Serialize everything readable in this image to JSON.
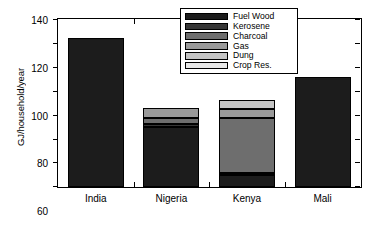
{
  "chart_data": {
    "type": "bar",
    "subtype": "stacked-vertical",
    "title": "",
    "xlabel": "",
    "ylabel": "GJ/household/year",
    "categories": [
      "India",
      "Nigeria",
      "Kenya",
      "Mali"
    ],
    "ylim": [
      0,
      140
    ],
    "yticks": [
      0,
      20,
      40,
      60,
      80,
      100,
      120,
      140
    ],
    "ytick_labels": [
      "0",
      "20",
      "40",
      "60",
      "80",
      "100",
      "120",
      "140"
    ],
    "grid": false,
    "legend_position": "top-right-inside",
    "series": [
      {
        "name": "Fuel Wood",
        "color": "#1c1c1c",
        "values": [
          125,
          50,
          10,
          92
        ]
      },
      {
        "name": "Kerosene",
        "color": "#363636",
        "values": [
          0,
          3,
          2,
          0
        ]
      },
      {
        "name": "Charcoal",
        "color": "#6e6e6e",
        "values": [
          0,
          5,
          46,
          0
        ]
      },
      {
        "name": "Gas",
        "color": "#9a9a9a",
        "values": [
          0,
          8,
          7,
          0
        ]
      },
      {
        "name": "Dung",
        "color": "#c4c4c4",
        "values": [
          0,
          0,
          8,
          0
        ]
      },
      {
        "name": "Crop Res.",
        "color": "#e8e8e8",
        "values": [
          0,
          0,
          0,
          0
        ]
      }
    ],
    "totals": [
      125,
      66,
      73,
      92
    ],
    "legend_entries": [
      "Fuel Wood",
      "Kerosene",
      "Charcoal",
      "Gas",
      "Dung",
      "Crop Res."
    ]
  }
}
